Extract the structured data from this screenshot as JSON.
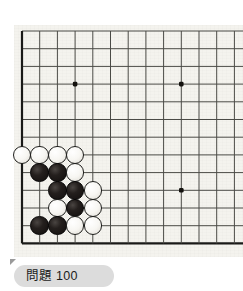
{
  "caption": {
    "label": "問題 100",
    "pill_color": "#dcdcdc"
  },
  "board": {
    "name": "go-board-diagram",
    "background_color": "#f4f3ee",
    "line_color": "#4a4a46",
    "edge_line_color": "#1a1a18",
    "cols_visible": 12,
    "rows_visible": 13,
    "cell_size": 17.7,
    "origin_x": 22,
    "origin_y": 31,
    "star_points": [
      {
        "col": 3,
        "row": 3
      },
      {
        "col": 9,
        "row": 3
      },
      {
        "col": 9,
        "row": 9
      }
    ],
    "bottom_edge_row": 12,
    "left_edge_col": 0
  },
  "stones": [
    {
      "color": "white",
      "col": 0,
      "row": 7
    },
    {
      "color": "white",
      "col": 1,
      "row": 7
    },
    {
      "color": "white",
      "col": 2,
      "row": 7
    },
    {
      "color": "white",
      "col": 3,
      "row": 7
    },
    {
      "color": "black",
      "col": 1,
      "row": 8
    },
    {
      "color": "black",
      "col": 2,
      "row": 8
    },
    {
      "color": "white",
      "col": 3,
      "row": 8
    },
    {
      "color": "black",
      "col": 2,
      "row": 9
    },
    {
      "color": "black",
      "col": 3,
      "row": 9
    },
    {
      "color": "white",
      "col": 4,
      "row": 9
    },
    {
      "color": "white",
      "col": 2,
      "row": 10
    },
    {
      "color": "black",
      "col": 3,
      "row": 10
    },
    {
      "color": "white",
      "col": 4,
      "row": 10
    },
    {
      "color": "black",
      "col": 1,
      "row": 11
    },
    {
      "color": "black",
      "col": 2,
      "row": 11
    },
    {
      "color": "white",
      "col": 3,
      "row": 11
    },
    {
      "color": "white",
      "col": 4,
      "row": 11
    }
  ],
  "colors": {
    "black_stone": "#141110",
    "white_stone": "#fbfaf6",
    "page_background": "#ffffff"
  }
}
